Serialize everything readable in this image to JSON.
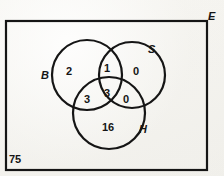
{
  "figure": {
    "type": "venn-diagram",
    "sets": 3,
    "universe": {
      "symbol": "E",
      "total": "75"
    },
    "set_labels": {
      "left": "B",
      "right": "S",
      "bottom": "H"
    },
    "regions": [
      {
        "name": "B-only",
        "value": "2"
      },
      {
        "name": "B-and-S",
        "value": "1"
      },
      {
        "name": "S-only",
        "value": "0"
      },
      {
        "name": "B-and-H",
        "value": "3"
      },
      {
        "name": "B-and-S-and-H",
        "value": "3"
      },
      {
        "name": "S-and-H",
        "value": "0"
      },
      {
        "name": "H-only",
        "value": "16"
      }
    ],
    "colors": {
      "ink": "#151515",
      "paper": "#f4f3ef"
    }
  }
}
